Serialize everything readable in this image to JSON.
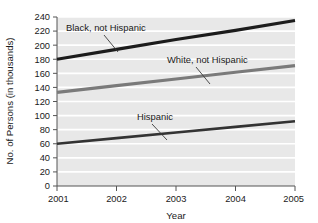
{
  "chart_data": {
    "type": "line",
    "title": "",
    "subtitle": "",
    "xlabel": "Year",
    "ylabel": "No. of Persons (in thousands)",
    "x": [
      2001,
      2002,
      2003,
      2004,
      2005
    ],
    "xlim": [
      2001,
      2005
    ],
    "ylim": [
      0,
      240
    ],
    "ytick_step": 20,
    "yticks": [
      0,
      20,
      40,
      60,
      80,
      100,
      120,
      140,
      160,
      180,
      200,
      220,
      240
    ],
    "ytick_labels": [
      "0",
      "20",
      "40",
      "60",
      "80",
      "100",
      "120",
      "140",
      "160",
      "180",
      "200",
      "220",
      "240"
    ],
    "xticks": [
      2001,
      2002,
      2003,
      2004,
      2005
    ],
    "xtick_labels": [
      "2001",
      "2002",
      "2003",
      "2004",
      "2005"
    ],
    "grid": "horizontal-white-on-gray",
    "legend_position": "inline-annotations",
    "plot_background": "#e8e8e8",
    "gridline_color": "#ffffff",
    "series": [
      {
        "name": "Black, not Hispanic",
        "color": "#1c1c1c",
        "width": 3.1,
        "values": [
          180,
          194,
          208,
          221,
          235
        ],
        "annotation": {
          "label": "Black, not Hispanic",
          "text_x": 66,
          "text_y": 31,
          "leader_from_x": 104,
          "leader_from_y": 35,
          "leader_to_x": 118,
          "leader_to_y": 52
        }
      },
      {
        "name": "White, not Hispanic",
        "color": "#7a7a7a",
        "width": 3.1,
        "values": [
          133,
          142.5,
          152,
          161.5,
          171
        ],
        "annotation": {
          "label": "White, not Hispanic",
          "text_x": 167,
          "text_y": 63,
          "leader_from_x": 196,
          "leader_from_y": 67,
          "leader_to_x": 210,
          "leader_to_y": 84
        }
      },
      {
        "name": "Hispanic",
        "color": "#333333",
        "width": 2.6,
        "values": [
          60,
          68,
          76,
          84,
          92
        ],
        "annotation": {
          "label": "Hispanic",
          "text_x": 137,
          "text_y": 120,
          "leader_from_x": 152,
          "leader_from_y": 124,
          "leader_to_x": 167,
          "leader_to_y": 140
        }
      }
    ]
  },
  "axes": {
    "y_axis_title": "No. of Persons (in thousands)",
    "x_axis_title": "Year"
  }
}
